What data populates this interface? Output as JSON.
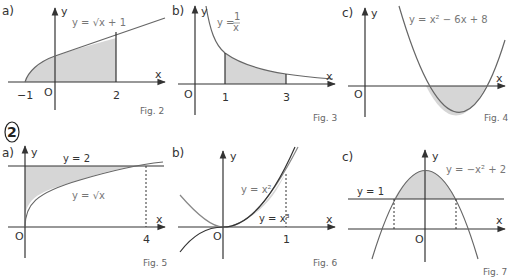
{
  "exercise_number": "2",
  "figures": [
    {
      "part": "a)",
      "caption": "Fig. 2",
      "equation": "y = √x + 1",
      "ticks": [
        "−1",
        "O",
        "2"
      ],
      "axis_x": "x",
      "axis_y": "y"
    },
    {
      "part": "b)",
      "caption": "Fig. 3",
      "equation_num": "1",
      "equation_den": "x",
      "equation_prefix": "y =",
      "ticks": [
        "O",
        "1",
        "3"
      ],
      "axis_x": "x",
      "axis_y": "y"
    },
    {
      "part": "c)",
      "caption": "Fig. 4",
      "equation": "y = x² − 6x + 8",
      "ticks": [
        "O"
      ],
      "axis_x": "x",
      "axis_y": "y"
    },
    {
      "part": "a)",
      "caption": "Fig. 5",
      "equation": "y = √x",
      "line_label": "y = 2",
      "ticks": [
        "O",
        "4"
      ],
      "axis_x": "x",
      "axis_y": "y"
    },
    {
      "part": "b)",
      "caption": "Fig. 6",
      "equation": "y = x²",
      "equation2": "y = x³",
      "ticks": [
        "O",
        "1"
      ],
      "axis_x": "x",
      "axis_y": "y"
    },
    {
      "part": "c)",
      "caption": "Fig. 7",
      "equation": "y = −x² + 2",
      "line_label": "y = 1",
      "ticks": [
        "O"
      ],
      "axis_x": "x",
      "axis_y": "y"
    }
  ],
  "colors": {
    "shade": "#d6d6d6",
    "curve": "#666666",
    "axis": "#333333"
  }
}
